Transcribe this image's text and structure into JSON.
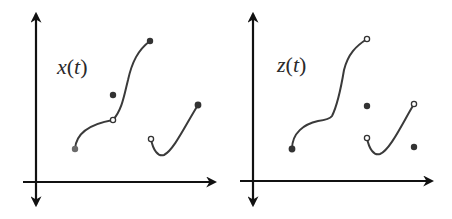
{
  "panels": [
    {
      "id": "left",
      "label_var": "x",
      "label_arg": "t",
      "label_open": "(",
      "label_close": ")",
      "axes": {
        "origin": [
          36,
          182
        ],
        "x_end": 215,
        "y_top": 14,
        "y_bottom": 205,
        "x_start": 23
      },
      "curves": [
        {
          "from": [
            75,
            149
          ],
          "via": [
            113,
            120
          ],
          "to": [
            150,
            41
          ],
          "start_marker": "filled",
          "end_marker": "filled",
          "mid_marker": "open"
        },
        {
          "from": [
            151,
            139
          ],
          "min": [
            161,
            155
          ],
          "to": [
            198,
            105
          ],
          "start_marker": "open",
          "end_marker": "filled"
        }
      ],
      "isolated_points": [
        {
          "at": [
            113,
            95
          ],
          "marker": "filled"
        }
      ]
    },
    {
      "id": "right",
      "label_var": "z",
      "label_arg": "t",
      "label_open": "(",
      "label_close": ")",
      "axes": {
        "origin": [
          253,
          181
        ],
        "x_end": 432,
        "y_top": 14,
        "y_bottom": 205,
        "x_start": 240
      },
      "curves": [
        {
          "from": [
            292,
            149
          ],
          "via": [
            330,
            119
          ],
          "to": [
            367,
            39
          ],
          "start_marker": "filled",
          "end_marker": "open"
        },
        {
          "from": [
            367,
            138
          ],
          "min": [
            378,
            154
          ],
          "to": [
            414,
            104
          ],
          "start_marker": "open",
          "end_marker": "open"
        }
      ],
      "isolated_points": [
        {
          "at": [
            367,
            106
          ],
          "marker": "filled"
        },
        {
          "at": [
            414,
            147
          ],
          "marker": "filled"
        }
      ]
    }
  ],
  "colors": {
    "axis": "#111111",
    "curve": "#3a3a3a",
    "point": "#333333",
    "background": "#ffffff"
  }
}
